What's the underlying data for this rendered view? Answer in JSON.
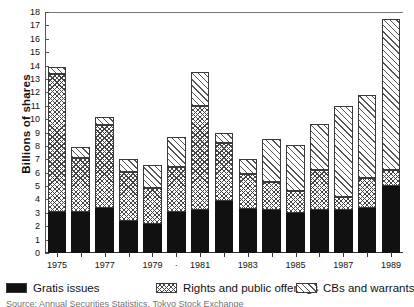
{
  "chart_data": {
    "type": "bar",
    "title": "",
    "subtitle": "",
    "xlabel": "",
    "ylabel": "Billions of shares",
    "ylim": [
      0,
      18
    ],
    "ytick_step": 1,
    "yticks": [
      0,
      1,
      2,
      3,
      4,
      5,
      6,
      7,
      8,
      9,
      10,
      11,
      12,
      13,
      14,
      15,
      16,
      17,
      18
    ],
    "grid": false,
    "stacked": true,
    "legend_position": "bottom",
    "categories": [
      "1975",
      "1976",
      "1977",
      "1978",
      "1979",
      "1980",
      "1981",
      "1982",
      "1983",
      "1984",
      "1985",
      "1986",
      "1987",
      "1988",
      "1989"
    ],
    "xtick_labels": [
      "1975",
      "",
      "1977",
      "",
      "1979",
      "·",
      "1981",
      "",
      "1983",
      "",
      "1985",
      "",
      "1987",
      "",
      "1989"
    ],
    "series": [
      {
        "name": "Gratis issues",
        "pattern": "solid-black",
        "color": "#111111",
        "values": [
          3.1,
          3.1,
          3.35,
          2.4,
          2.15,
          3.05,
          3.25,
          3.85,
          3.3,
          3.2,
          3.0,
          3.25,
          3.2,
          3.35,
          5.0
        ]
      },
      {
        "name": "Rights and public offerings",
        "pattern": "cross-hatch",
        "color": "#444444",
        "values": [
          10.3,
          4.0,
          6.2,
          3.65,
          2.7,
          3.35,
          7.75,
          4.4,
          2.6,
          2.1,
          1.6,
          2.95,
          0.95,
          2.25,
          1.2
        ]
      },
      {
        "name": "CBs and warrants",
        "pattern": "diagonal-hatch",
        "color": "#555555",
        "values": [
          0.5,
          0.8,
          0.6,
          0.95,
          1.75,
          2.25,
          2.5,
          0.75,
          1.15,
          3.2,
          3.5,
          3.4,
          6.85,
          6.2,
          11.3
        ]
      }
    ],
    "totals": [
      13.9,
      7.9,
      10.15,
      7.0,
      6.6,
      8.65,
      13.5,
      9.0,
      7.05,
      8.5,
      8.1,
      9.6,
      11.0,
      11.8,
      17.5
    ]
  },
  "legend": {
    "items": [
      {
        "label": "Gratis issues",
        "swatch": "solid-black-swatch"
      },
      {
        "label": "Rights and public offerings",
        "swatch": "cross-hatch-swatch"
      },
      {
        "label": "CBs and warrants",
        "swatch": "diagonal-hatch-swatch"
      }
    ]
  },
  "source_note": "Source: Annual Securities Statistics, Tokyo Stock Exchange"
}
